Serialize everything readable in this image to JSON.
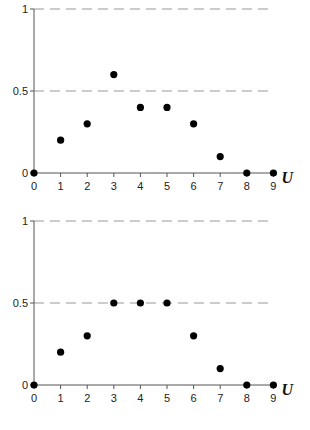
{
  "chart_data": [
    {
      "type": "scatter",
      "title": "",
      "xlabel": "U",
      "ylabel": "",
      "x": [
        0,
        1,
        2,
        3,
        4,
        5,
        6,
        7,
        8,
        9
      ],
      "values": [
        0,
        0.2,
        0.3,
        0.6,
        0.4,
        0.4,
        0.3,
        0.1,
        0,
        0
      ],
      "xticks": [
        "0",
        "1",
        "2",
        "3",
        "4",
        "5",
        "6",
        "7",
        "8",
        "9"
      ],
      "yticks": [
        "0",
        "0.5",
        "1"
      ],
      "xlim": [
        0,
        9
      ],
      "ylim": [
        0,
        1
      ],
      "grid": "dashed horizontal at 0.5 and 1",
      "legend": "none"
    },
    {
      "type": "scatter",
      "title": "",
      "xlabel": "U",
      "ylabel": "",
      "x": [
        0,
        1,
        2,
        3,
        4,
        5,
        6,
        7,
        8,
        9
      ],
      "values": [
        0,
        0.2,
        0.3,
        0.5,
        0.5,
        0.5,
        0.3,
        0.1,
        0,
        0
      ],
      "xticks": [
        "0",
        "1",
        "2",
        "3",
        "4",
        "5",
        "6",
        "7",
        "8",
        "9"
      ],
      "yticks": [
        "0",
        "0.5",
        "1"
      ],
      "xlim": [
        0,
        9
      ],
      "ylim": [
        0,
        1
      ],
      "grid": "dashed horizontal at 0.5 and 1",
      "legend": "none"
    }
  ],
  "charts": [
    {
      "top": 0,
      "y0": 173,
      "y1": 9
    },
    {
      "top": 0,
      "y0": 385,
      "y1": 221
    }
  ],
  "layout": {
    "x0": 34,
    "dx": 26.6,
    "dash_end": 270
  },
  "colors": {
    "axis": "#555555",
    "grid": "#999999",
    "point": "#000000",
    "text": "#222222"
  }
}
